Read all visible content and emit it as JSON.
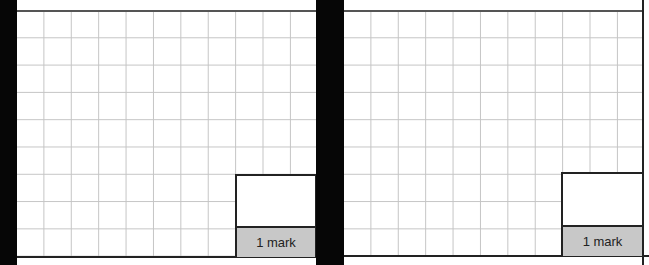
{
  "panels": [
    {
      "mark_label": "1 mark"
    },
    {
      "mark_label": "1 mark"
    }
  ],
  "colors": {
    "grid_line": "#c4c4c4",
    "border": "#222222",
    "mark_background": "#c8c8c8",
    "separator": "#060606"
  }
}
